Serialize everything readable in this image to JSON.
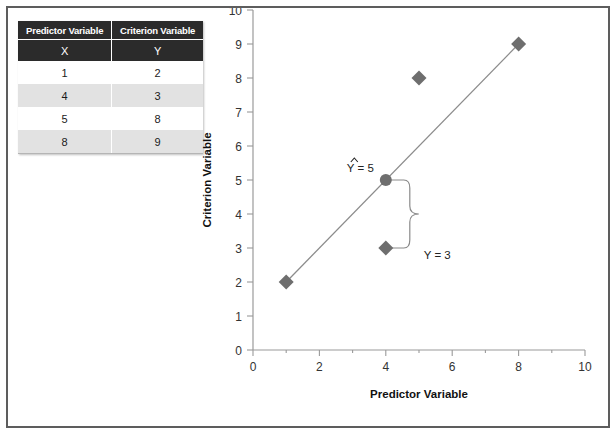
{
  "figure": {
    "border_color": "#5d5d5d",
    "background": "#ffffff"
  },
  "table": {
    "name": "predictor-criterion-table",
    "headers": [
      "Predictor Variable",
      "Criterion Variable"
    ],
    "symbols": [
      "X",
      "Y"
    ],
    "rows": [
      [
        "1",
        "2"
      ],
      [
        "4",
        "3"
      ],
      [
        "5",
        "8"
      ],
      [
        "8",
        "9"
      ]
    ],
    "header_bg": "#2b2b2b",
    "alt_row_bg": "#e2e2e2"
  },
  "chart_data": {
    "type": "scatter",
    "title": "",
    "xlabel": "Predictor Variable",
    "ylabel": "Criterion Variable",
    "xlim": [
      0,
      10
    ],
    "ylim": [
      0,
      10
    ],
    "xticks": [
      0,
      2,
      4,
      6,
      8,
      10
    ],
    "xtick_labels": [
      "0",
      "2",
      "4",
      "6",
      "8",
      "10"
    ],
    "xminor_ticks": [
      1,
      3,
      5,
      7,
      9
    ],
    "yticks": [
      0,
      1,
      2,
      3,
      4,
      5,
      6,
      7,
      8,
      9,
      10
    ],
    "ytick_labels": [
      "0",
      "1",
      "2",
      "3",
      "4",
      "5",
      "6",
      "7",
      "8",
      "9",
      "10"
    ],
    "grid": false,
    "legend": null,
    "marker_color": "#6e6e6e",
    "line_color": "#8c8c8c",
    "series": [
      {
        "name": "Observations",
        "marker": "diamond",
        "x": [
          1,
          4,
          5,
          8
        ],
        "y": [
          2,
          3,
          8,
          9
        ]
      },
      {
        "name": "Regression line",
        "marker": "none",
        "x": [
          1,
          8
        ],
        "y": [
          2,
          9
        ]
      },
      {
        "name": "Predicted value",
        "marker": "circle",
        "x": [
          4
        ],
        "y": [
          5
        ]
      }
    ],
    "annotations": [
      {
        "name": "predicted-label",
        "text": "Ÿ = 5",
        "x": 4,
        "y": 5
      },
      {
        "name": "observed-label",
        "text": "Y = 3",
        "x": 4,
        "y": 3
      },
      {
        "name": "residual-brace",
        "text": "",
        "x": 4,
        "y": 4
      }
    ]
  },
  "axis": {
    "x_title": "Predictor Variable",
    "y_title": "Criterion Variable"
  },
  "annotations": {
    "predicted": "= 5",
    "predicted_symbol": "Y",
    "observed": "Y = 3"
  }
}
